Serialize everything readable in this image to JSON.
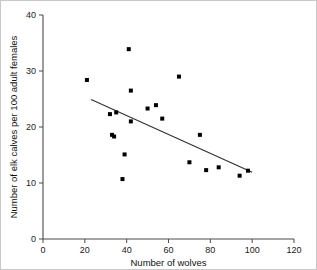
{
  "figure": {
    "background_color": "#ffffff",
    "border_color": "#c8c8c8",
    "point_color": "#000000",
    "line_color": "#303030",
    "axis_color": "#4a4a4a"
  },
  "chart_data": {
    "type": "scatter",
    "title": "",
    "xlabel": "Number of wolves",
    "ylabel": "Number of elk calves per 100 adult females",
    "xlim": [
      0,
      120
    ],
    "ylim": [
      0,
      40
    ],
    "xticks": [
      0,
      20,
      40,
      60,
      80,
      100,
      120
    ],
    "yticks": [
      0,
      10,
      20,
      30,
      40
    ],
    "xtick_labels": [
      "0",
      "20",
      "40",
      "60",
      "80",
      "100",
      "120"
    ],
    "ytick_labels": [
      "0",
      "10",
      "20",
      "30",
      "40"
    ],
    "grid": false,
    "legend": null,
    "points": [
      {
        "x": 21,
        "y": 28.4
      },
      {
        "x": 32,
        "y": 22.3
      },
      {
        "x": 33,
        "y": 18.6
      },
      {
        "x": 34,
        "y": 18.3
      },
      {
        "x": 35,
        "y": 22.6
      },
      {
        "x": 38,
        "y": 10.7
      },
      {
        "x": 39,
        "y": 15.1
      },
      {
        "x": 41,
        "y": 33.9
      },
      {
        "x": 42,
        "y": 21.0
      },
      {
        "x": 42,
        "y": 26.5
      },
      {
        "x": 50,
        "y": 23.3
      },
      {
        "x": 54,
        "y": 23.9
      },
      {
        "x": 57,
        "y": 21.5
      },
      {
        "x": 65,
        "y": 29.0
      },
      {
        "x": 70,
        "y": 13.7
      },
      {
        "x": 75,
        "y": 18.6
      },
      {
        "x": 78,
        "y": 12.3
      },
      {
        "x": 84,
        "y": 12.8
      },
      {
        "x": 94,
        "y": 11.3
      },
      {
        "x": 98,
        "y": 12.2
      }
    ],
    "trend_line": {
      "x_start": 23,
      "y_start": 24.9,
      "x_end": 100,
      "y_end": 11.9
    }
  }
}
